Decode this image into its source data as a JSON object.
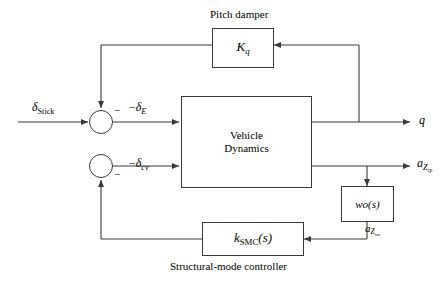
{
  "diagram": {
    "captions": {
      "pitch_damper": "Pitch damper",
      "structural_mode_controller": "Structural-mode controller"
    },
    "blocks": [
      {
        "id": "pitch_damper",
        "label_main": "K",
        "label_sub": "q",
        "name": "pitch-damper-block"
      },
      {
        "id": "vehicle_dynamics",
        "line1": "Vehicle",
        "line2": "Dynamics",
        "name": "vehicle-dynamics-block"
      },
      {
        "id": "washout",
        "label_main": "wo",
        "label_arg": "(s)",
        "name": "washout-filter-block"
      },
      {
        "id": "smc",
        "label_main": "k",
        "label_sub": "SMC",
        "label_arg": "(s)",
        "name": "structural-mode-controller-block"
      }
    ],
    "signals": {
      "input_stick": {
        "base": "δ",
        "sub": "Stick"
      },
      "delta_e": {
        "prefix": "−",
        "base": "δ",
        "sub": "E"
      },
      "delta_cv": {
        "prefix": "−",
        "base": "δ",
        "sub": "cv"
      },
      "output_q": {
        "base": "q"
      },
      "a_z_cp": {
        "base": "a",
        "sub": "Z",
        "sub2": "cp"
      },
      "a_z_wo": {
        "base": "a",
        "sub": "Z",
        "sub2": "wo"
      }
    },
    "summing_junctions": [
      {
        "id": "sum_top",
        "sign": "−",
        "name": "summing-junction-pitch"
      },
      {
        "id": "sum_bottom",
        "sign": "−",
        "name": "summing-junction-structural"
      }
    ],
    "colors": {
      "line": "#3a3a3a",
      "text": "#000000",
      "background": "#ffffff"
    }
  }
}
